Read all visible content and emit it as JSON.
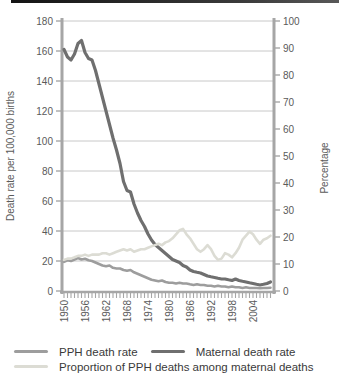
{
  "chart_data": {
    "type": "line",
    "x": [
      1950,
      1951,
      1952,
      1953,
      1954,
      1955,
      1956,
      1957,
      1958,
      1959,
      1960,
      1961,
      1962,
      1963,
      1964,
      1965,
      1966,
      1967,
      1968,
      1969,
      1970,
      1971,
      1972,
      1973,
      1974,
      1975,
      1976,
      1977,
      1978,
      1979,
      1980,
      1981,
      1982,
      1983,
      1984,
      1985,
      1986,
      1987,
      1988,
      1989,
      1990,
      1991,
      1992,
      1993,
      1994,
      1995,
      1996,
      1997,
      1998,
      1999,
      2000,
      2001,
      2002,
      2003,
      2004,
      2005,
      2006,
      2007,
      2008,
      2009
    ],
    "series": [
      {
        "name": "PPH death rate",
        "axis": "left",
        "color": "#9d9d9d",
        "width": 2.6,
        "values": [
          19.5,
          20.5,
          20,
          21,
          22,
          21,
          21.5,
          20.5,
          20,
          19,
          18,
          17,
          16.5,
          17,
          15.5,
          15,
          15,
          14,
          13.5,
          14,
          12.5,
          11.5,
          10.5,
          9.5,
          8.5,
          7.5,
          7,
          6.5,
          7,
          6,
          5.5,
          5.5,
          5,
          5.5,
          5,
          5,
          4.5,
          4,
          4.5,
          4,
          4,
          3.5,
          3.5,
          3,
          3.5,
          3,
          3,
          2.5,
          3,
          2.5,
          2.5,
          2,
          2.5,
          2,
          2,
          2,
          1.8,
          2,
          2,
          2.2
        ]
      },
      {
        "name": "Maternal death rate",
        "axis": "left",
        "color": "#6f6f6f",
        "width": 3.2,
        "values": [
          161,
          156,
          154,
          158,
          165,
          167,
          159,
          155,
          154,
          147,
          138,
          129,
          120,
          111,
          102,
          94,
          85,
          73,
          67,
          66,
          58,
          52,
          47,
          43,
          38,
          34,
          31,
          29,
          27,
          25,
          23,
          21,
          20,
          19,
          17,
          16,
          14,
          13,
          12.5,
          12,
          11,
          10,
          9.5,
          9,
          8.5,
          8,
          8,
          7.5,
          7,
          8,
          7,
          6.5,
          6,
          5.5,
          5,
          4.5,
          4,
          4.5,
          5,
          6
        ]
      },
      {
        "name": "Proportion of PPH deaths among maternal deaths",
        "axis": "right",
        "color": "#dcdcd4",
        "width": 2.6,
        "values": [
          11.5,
          12,
          12,
          12.5,
          13,
          13,
          13.5,
          13,
          13.5,
          13.5,
          13.5,
          14,
          14,
          13.5,
          14,
          14.5,
          15,
          15.5,
          15,
          15.5,
          14.5,
          15,
          15.5,
          15.5,
          16,
          16.5,
          17,
          17.5,
          17,
          18,
          18.5,
          19.5,
          21,
          22.5,
          23,
          21,
          19.5,
          17.5,
          15.5,
          14.5,
          15.5,
          17,
          15.5,
          13,
          11.5,
          12,
          14,
          13.5,
          12.5,
          14,
          16,
          19,
          20.5,
          22,
          21,
          19,
          17.5,
          19,
          19.5,
          20.5
        ]
      }
    ],
    "left_axis": {
      "label": "Death rate per 100,000 births",
      "min": 0,
      "max": 180,
      "ticks": [
        0,
        20,
        40,
        60,
        80,
        100,
        120,
        140,
        160,
        180
      ]
    },
    "right_axis": {
      "label": "Percentage",
      "min": 0,
      "max": 100,
      "ticks": [
        0,
        10,
        20,
        30,
        40,
        50,
        60,
        70,
        80,
        90,
        100
      ]
    },
    "x_axis": {
      "labeled_years": [
        1950,
        1956,
        1962,
        1968,
        1974,
        1980,
        1986,
        1992,
        1998,
        2004
      ],
      "tick_every_year": true
    },
    "grid": "horizontal",
    "legend_position": "bottom",
    "colors": {
      "gridline": "#c8c8c8",
      "axis_bar": "#a6a6a6",
      "tick_text": "#5a5a5a"
    }
  },
  "legend": {
    "items": [
      {
        "label": "PPH death rate"
      },
      {
        "label": "Maternal death rate"
      },
      {
        "label": "Proportion of PPH deaths among maternal deaths"
      }
    ]
  }
}
